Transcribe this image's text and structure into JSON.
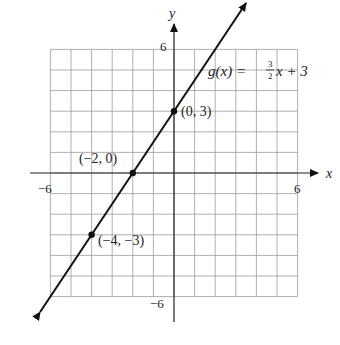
{
  "chart_data": {
    "type": "line",
    "title": "",
    "function_label": "g(x) = 3/2 x + 3",
    "function_name": "g(x) =",
    "slope_num": "3",
    "slope_den": "2",
    "function_rest": "x + 3",
    "xlabel": "x",
    "ylabel": "y",
    "xlim": [
      -6,
      6
    ],
    "ylim": [
      -6,
      6
    ],
    "grid": true,
    "x_ticks": [
      "−6",
      "6"
    ],
    "y_ticks": [
      "6",
      "−6"
    ],
    "series": [
      {
        "name": "g(x)",
        "slope": 1.5,
        "intercept": 3
      }
    ],
    "points": [
      {
        "x": 0,
        "y": 3,
        "label": "(0, 3)"
      },
      {
        "x": -2,
        "y": 0,
        "label": "(−2, 0)"
      },
      {
        "x": -4,
        "y": -3,
        "label": "(−4, −3)"
      }
    ]
  }
}
